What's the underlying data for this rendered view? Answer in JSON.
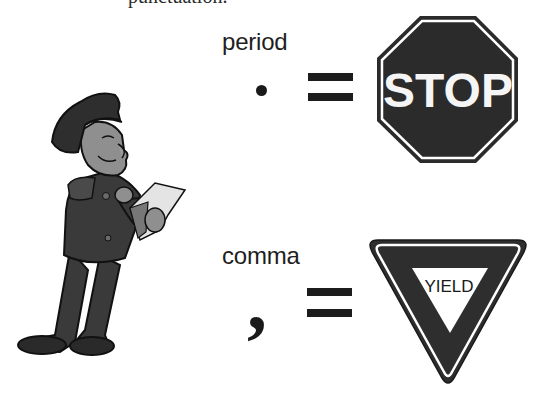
{
  "heading": {
    "clipped_text": "punctuation."
  },
  "rows": [
    {
      "label": "period",
      "symbol": "•",
      "equals": "=",
      "sign": {
        "shape": "octagon",
        "text": "STOP",
        "fill": "#2b2b2b",
        "text_color": "#f5f5f5"
      }
    },
    {
      "label": "comma",
      "symbol": ",",
      "equals": "=",
      "sign": {
        "shape": "inverted-triangle",
        "text": "YIELD",
        "fill": "#2e2e2e",
        "text_color": "#1a1a1a",
        "inner_fill": "#ffffff"
      }
    }
  ],
  "illustration": {
    "subject": "police officer writing on notepad",
    "palette": {
      "uniform": "#3a3a3a",
      "skin": "#8f8f8f",
      "paper": "#e4e4e4",
      "outline": "#111111"
    }
  }
}
